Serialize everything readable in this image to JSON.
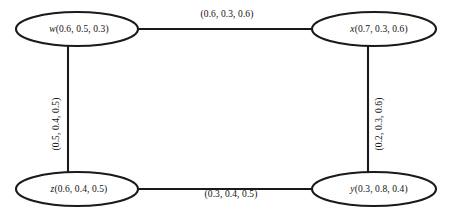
{
  "diagram": {
    "type": "undirected-graph",
    "nodes": [
      {
        "id": "w",
        "vertex": "w",
        "values": "(0.6, 0.5, 0.3)",
        "label": "w(0.6, 0.5, 0.3)",
        "cx": 77,
        "cy": 29,
        "rx": 61,
        "ry": 17
      },
      {
        "id": "x",
        "vertex": "x",
        "values": "(0.7, 0.3, 0.6)",
        "label": "x(0.7, 0.3, 0.6)",
        "cx": 374,
        "cy": 29,
        "rx": 62,
        "ry": 17
      },
      {
        "id": "z",
        "vertex": "z",
        "values": "(0.6, 0.4, 0.5)",
        "label": "z(0.6, 0.4, 0.5)",
        "cx": 77,
        "cy": 189,
        "rx": 61,
        "ry": 17
      },
      {
        "id": "y",
        "vertex": "y",
        "values": "(0.3, 0.8, 0.4)",
        "label": "y(0.3, 0.8, 0.4)",
        "cx": 374,
        "cy": 189,
        "rx": 62,
        "ry": 17
      }
    ],
    "edges": [
      {
        "id": "w-x",
        "from": "w",
        "to": "x",
        "label": "(0.6, 0.3, 0.6)",
        "orientation": "horizontal",
        "lx": 227,
        "ly": 14
      },
      {
        "id": "w-z",
        "from": "w",
        "to": "z",
        "label": "(0.5, 0.4, 0.5)",
        "orientation": "vertical-left",
        "lx": 56,
        "ly": 124
      },
      {
        "id": "x-y",
        "from": "x",
        "to": "y",
        "label": "(0.2, 0.3, 0.6)",
        "orientation": "vertical-right",
        "lx": 379,
        "ly": 124
      },
      {
        "id": "z-y",
        "from": "z",
        "to": "y",
        "label": "(0.3, 0.4, 0.5)",
        "orientation": "horizontal",
        "lx": 231,
        "ly": 194
      }
    ],
    "colors": {
      "stroke": "#1a1a1a",
      "fill": "#ffffff",
      "text": "#111111",
      "background": "#ffffff"
    }
  }
}
